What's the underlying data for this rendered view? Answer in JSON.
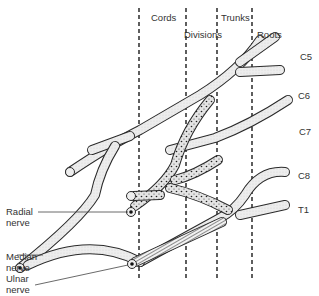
{
  "diagram": {
    "regions": [
      {
        "label": "Cords"
      },
      {
        "label": "Divisions"
      },
      {
        "label": "Trunks"
      },
      {
        "label": "Roots"
      }
    ],
    "roots": [
      {
        "label": "C5"
      },
      {
        "label": "C6"
      },
      {
        "label": "C7"
      },
      {
        "label": "C8"
      },
      {
        "label": "T1"
      }
    ],
    "nerves": [
      {
        "line1": "Radial",
        "line2": "nerve"
      },
      {
        "line1": "Median",
        "line2": "nerve"
      },
      {
        "line1": "Ulnar",
        "line2": "nerve"
      }
    ],
    "colors": {
      "outline": "#2a2a2a",
      "fill_lateral": "#e6e6e6",
      "fill_posterior": "#d8d8d8",
      "dashed": "#1a1a1a",
      "background": "#ffffff"
    }
  }
}
